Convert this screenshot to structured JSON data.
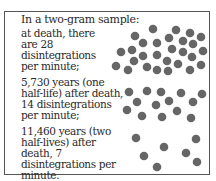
{
  "figure": {
    "heading": "In a two-gram sample:",
    "stages": [
      {
        "text": "at death, there are 28 disintegrations per minute;",
        "disintegrations_per_minute": 28
      },
      {
        "text": "5,730 years (one half-life) after death, 14 disintegrations per minute;",
        "disintegrations_per_minute": 14
      },
      {
        "text": "11,460 years (two half-lives) after death, 7 disintegrations per minute.",
        "disintegrations_per_minute": 7
      }
    ],
    "dot_color": "#666666",
    "border_color": "#555555"
  }
}
